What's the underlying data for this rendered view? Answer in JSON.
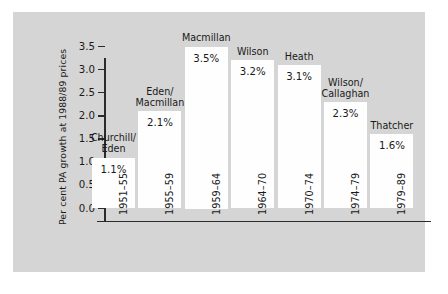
{
  "chart_data": {
    "type": "bar",
    "title": "",
    "xlabel": "",
    "ylabel": "Per cent PA growth at 1988/89 prices",
    "ylim": [
      0.0,
      3.5
    ],
    "yticks": [
      "0.0",
      "0.5",
      "1.0",
      "1.5",
      "2.0",
      "2.5",
      "3.0",
      "3.5"
    ],
    "ytick_values": [
      0.0,
      0.5,
      1.0,
      1.5,
      2.0,
      2.5,
      3.0,
      3.5
    ],
    "grid": false,
    "legend": "none",
    "categories": [
      "1951–55",
      "1955–59",
      "1959–64",
      "1964–70",
      "1970–74",
      "1974–79",
      "1979–89"
    ],
    "values": [
      1.1,
      2.1,
      3.5,
      3.2,
      3.1,
      2.3,
      1.6
    ],
    "value_labels": [
      "1.1%",
      "2.1%",
      "3.5%",
      "3.2%",
      "3.1%",
      "2.3%",
      "1.6%"
    ],
    "annotations": [
      "Churchill/\nEden",
      "Eden/\nMacmillan",
      "Macmillan",
      "Wilson",
      "Heath",
      "Wilson/\nCallaghan",
      "Thatcher"
    ],
    "bar_color": "#fefefe",
    "background_color": "#d5d5d5",
    "axis_color": "#2b2b2b"
  },
  "bars": [
    {
      "name": "Churchill/Eden",
      "label_line1": "Churchill/",
      "label_line2": "Eden",
      "value_label": "1.1%",
      "value": 1.1,
      "period": "1951–55"
    },
    {
      "name": "Eden/Macmillan",
      "label_line1": "Eden/",
      "label_line2": "Macmillan",
      "value_label": "2.1%",
      "value": 2.1,
      "period": "1955–59"
    },
    {
      "name": "Macmillan",
      "label_line1": "Macmillan",
      "label_line2": "",
      "value_label": "3.5%",
      "value": 3.5,
      "period": "1959–64"
    },
    {
      "name": "Wilson",
      "label_line1": "Wilson",
      "label_line2": "",
      "value_label": "3.2%",
      "value": 3.2,
      "period": "1964–70"
    },
    {
      "name": "Heath",
      "label_line1": "Heath",
      "label_line2": "",
      "value_label": "3.1%",
      "value": 3.1,
      "period": "1970–74"
    },
    {
      "name": "Wilson/Callaghan",
      "label_line1": "Wilson/",
      "label_line2": "Callaghan",
      "value_label": "2.3%",
      "value": 2.3,
      "period": "1974–79"
    },
    {
      "name": "Thatcher",
      "label_line1": "Thatcher",
      "label_line2": "",
      "value_label": "1.6%",
      "value": 1.6,
      "period": "1979–89"
    }
  ],
  "yaxis": {
    "title": "Per cent PA growth at 1988/89 prices",
    "ticks": [
      "3.5",
      "3.0",
      "2.5",
      "2.0",
      "1.5",
      "1.0",
      "0.5",
      "0.0"
    ]
  }
}
